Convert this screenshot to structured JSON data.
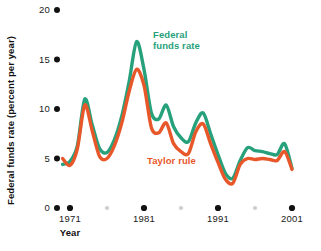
{
  "chart_data": {
    "type": "line",
    "title": "",
    "xlabel": "Year",
    "ylabel": "Federal funds rate (percent per year)",
    "xlim": [
      1970,
      2002
    ],
    "ylim": [
      0,
      20
    ],
    "ytick_values": [
      0,
      5,
      10,
      15,
      20
    ],
    "ytick_labels": [
      "0",
      "5",
      "10",
      "15",
      "20"
    ],
    "xtick_values": [
      1971,
      1981,
      1991,
      2001
    ],
    "xtick_labels": [
      "1971",
      "1981",
      "1991",
      "2001"
    ],
    "xtick_minor_values": [
      1976,
      1986,
      1996
    ],
    "grid": false,
    "legend_position": "inline-annotations",
    "x": [
      1970,
      1971,
      1972,
      1973,
      1974,
      1975,
      1976,
      1977,
      1978,
      1979,
      1980,
      1981,
      1982,
      1983,
      1984,
      1985,
      1986,
      1987,
      1988,
      1989,
      1990,
      1991,
      1992,
      1993,
      1994,
      1995,
      1996,
      1997,
      1998,
      1999,
      2000,
      2001
    ],
    "series": [
      {
        "name": "Federal funds rate",
        "color": "#27a17b",
        "label_color": "#27a17b",
        "values": [
          4.4,
          4.7,
          6.3,
          11.0,
          8.4,
          6.0,
          5.6,
          6.9,
          9.3,
          12.8,
          16.8,
          14.0,
          9.6,
          9.0,
          10.4,
          8.2,
          7.1,
          6.7,
          8.6,
          9.6,
          7.5,
          5.4,
          3.5,
          3.0,
          4.8,
          6.1,
          5.8,
          5.7,
          5.5,
          5.4,
          6.5,
          4.0
        ],
        "annotation": "Federal\nfunds rate"
      },
      {
        "name": "Taylor rule",
        "color": "#e8572a",
        "label_color": "#e8572a",
        "values": [
          5.0,
          4.3,
          6.0,
          10.4,
          7.8,
          5.2,
          5.0,
          6.3,
          8.6,
          11.8,
          14.0,
          12.4,
          8.1,
          7.6,
          8.6,
          6.5,
          5.7,
          5.5,
          7.7,
          8.5,
          6.5,
          4.6,
          2.9,
          2.5,
          4.4,
          5.0,
          4.9,
          5.0,
          4.9,
          4.8,
          5.7,
          3.9
        ],
        "annotation": "Taylor rule"
      }
    ],
    "annotations": [
      {
        "text_line1": "Federal",
        "text_line2": "funds rate",
        "color": "#27a17b",
        "x": 153,
        "y": 38
      },
      {
        "text_line1": "Taylor rule",
        "text_line2": "",
        "color": "#e8572a",
        "x": 147,
        "y": 164
      }
    ]
  }
}
